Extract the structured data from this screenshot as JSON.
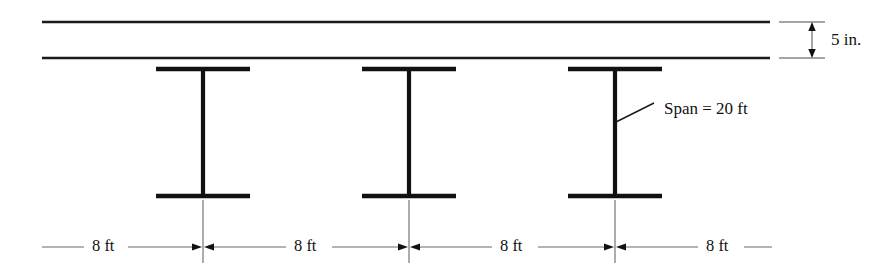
{
  "slab": {
    "name": "concrete-slab",
    "thickness_label": "5 in.",
    "top_y": 22,
    "bottom_y": 58,
    "left_x": 42,
    "right_x": 770
  },
  "beams": [
    {
      "id": "beam-1",
      "center_x": 203,
      "label": ""
    },
    {
      "id": "beam-2",
      "center_x": 409,
      "label": ""
    },
    {
      "id": "beam-3",
      "center_x": 615,
      "label": ""
    }
  ],
  "beam_geometry": {
    "flange_half_width": 47,
    "top_flange_y": 69,
    "bottom_flange_y": 196,
    "web_top_y": 69,
    "web_bottom_y": 196
  },
  "annotations": {
    "span": {
      "text": "Span = 20 ft",
      "x": 664,
      "y": 110,
      "leader_from_x": 615,
      "leader_from_y": 122,
      "leader_to_x": 654,
      "leader_to_y": 103
    },
    "slab_thickness": {
      "text": "5 in.",
      "x": 832,
      "y": 41,
      "arrow_x": 812,
      "ext_left_x": 778,
      "ext_right_x": 824,
      "top_y": 22,
      "bottom_y": 58
    }
  },
  "spacing_dimensions": {
    "line_y": 247,
    "labels": [
      {
        "text": "8 ft",
        "x": 104
      },
      {
        "text": "8 ft",
        "x": 306
      },
      {
        "text": "8 ft",
        "x": 512
      },
      {
        "text": "8 ft",
        "x": 718
      }
    ],
    "extension_lines": [
      {
        "x": 203,
        "top_y": 200,
        "bottom_y": 263
      },
      {
        "x": 409,
        "top_y": 200,
        "bottom_y": 263
      },
      {
        "x": 615,
        "top_y": 200,
        "bottom_y": 263
      }
    ],
    "left_end_x": 42,
    "right_end_x": 772
  },
  "colors": {
    "background": "#ffffff",
    "line": "#111111",
    "dimension_line": "#5a5a5a",
    "text": "#111111"
  }
}
